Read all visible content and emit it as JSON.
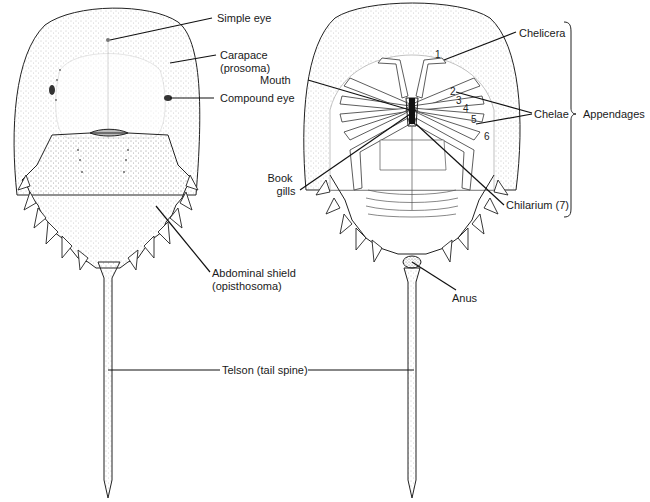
{
  "figure": {
    "views": [
      {
        "id": "dorsal",
        "description": "Dorsal (top) view"
      },
      {
        "id": "ventral",
        "description": "Ventral (underside) view"
      }
    ],
    "colors": {
      "ink": "#1a1a1a",
      "stipple": "#9a9a9a",
      "background": "#ffffff"
    }
  },
  "labels": {
    "simple_eye": "Simple eye",
    "carapace_1": "Carapace",
    "carapace_2": "(prosoma)",
    "compound_eye": "Compound eye",
    "abdominal_1": "Abdominal shield",
    "abdominal_2": "(opisthosoma)",
    "telson": "Telson (tail spine)",
    "chelicera": "Chelicera",
    "mouth": "Mouth",
    "chelae": "Chelae",
    "appendages": "Appendages",
    "book_1": "Book",
    "book_2": "gills",
    "chilarium": "Chilarium (7)",
    "anus": "Anus"
  },
  "appendage_numbers": [
    "1",
    "2",
    "3",
    "4",
    "5",
    "6"
  ]
}
